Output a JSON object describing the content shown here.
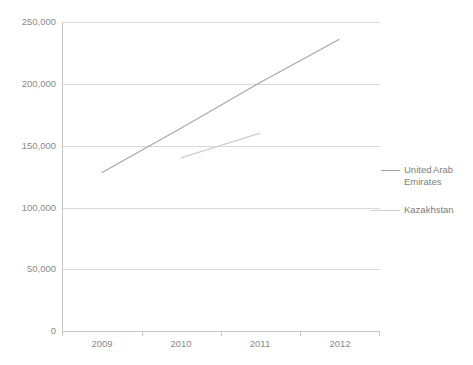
{
  "chart_data": {
    "type": "line",
    "title": "",
    "xlabel": "",
    "ylabel": "",
    "categories": [
      "2009",
      "2010",
      "2011",
      "2012"
    ],
    "ylim": [
      0,
      250000
    ],
    "ytick_values": [
      0,
      50000,
      100000,
      150000,
      200000,
      250000
    ],
    "ytick_labels": [
      "0",
      "50,000",
      "100,000",
      "150,000",
      "200,000",
      "250,000"
    ],
    "grid": true,
    "legend_position": "right",
    "series": [
      {
        "name": "United Arab Emirates",
        "color": "#a6a6a6",
        "x": [
          "2009",
          "2010",
          "2011",
          "2012"
        ],
        "values": [
          128000,
          164000,
          201000,
          236000
        ]
      },
      {
        "name": "Kazakhstan",
        "color": "#cfcfcf",
        "x": [
          "2010",
          "2011"
        ],
        "values": [
          140000,
          160000
        ]
      }
    ]
  },
  "legend": {
    "entries": [
      {
        "label_line1": "United Arab",
        "label_line2": "Emirates"
      },
      {
        "label_line1": "Kazakhstan",
        "label_line2": ""
      }
    ]
  },
  "axes": {
    "y_labels": [
      "250,000",
      "200,000",
      "150,000",
      "100,000",
      "50,000",
      "0"
    ],
    "x_labels": [
      "2009",
      "2010",
      "2011",
      "2012"
    ]
  },
  "colors": {
    "gridline": "#d9d9d9",
    "axis": "#c6c6c6",
    "text": "#8a8a8a",
    "series_uae": "#a6a6a6",
    "series_kazakhstan": "#cfcfcf",
    "background": "#ffffff"
  }
}
